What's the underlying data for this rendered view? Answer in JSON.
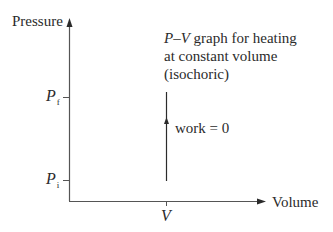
{
  "diagram": {
    "title_lines": [
      {
        "italic": "P–V",
        "rest": " graph for heating"
      },
      {
        "italic": "",
        "rest": "at constant volume"
      },
      {
        "italic": "",
        "rest": "(isochoric)"
      }
    ],
    "axes": {
      "y_label": "Pressure",
      "x_label": "Volume"
    },
    "ticks": {
      "p_final": {
        "main": "P",
        "sub": "f"
      },
      "p_initial": {
        "main": "P",
        "sub": "i"
      },
      "volume": "V"
    },
    "process_label": "work = 0",
    "colors": {
      "line": "#2b2b2b",
      "axis": "#555555",
      "text": "#2b2b2b",
      "background": "#ffffff"
    }
  }
}
